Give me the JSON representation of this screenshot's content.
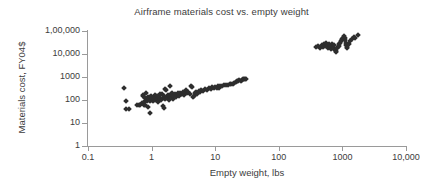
{
  "chart_data": {
    "type": "scatter",
    "title": "Airframe materials cost vs. empty weight",
    "xlabel": "Empty weight, lbs",
    "ylabel": "Materials cost, FY04$",
    "xscale": "log",
    "yscale": "log",
    "xlim": [
      0.1,
      10000
    ],
    "ylim": [
      1,
      100000
    ],
    "grid": false,
    "legend": null,
    "marker": "diamond",
    "marker_color": "#2e2e2e",
    "axis_color": "#9a9a9a",
    "xticks": [
      0.1,
      1,
      10,
      100,
      1000,
      10000
    ],
    "xticklabels": [
      "0.1",
      "1",
      "10",
      "100",
      "1000",
      "10,000"
    ],
    "yticks": [
      1,
      10,
      100,
      1000,
      10000,
      100000
    ],
    "yticklabels": [
      "1",
      "10",
      "100",
      "1000",
      "10,000",
      "1,00,000"
    ],
    "series": [
      {
        "name": "Small UAV airframes",
        "points": [
          [
            0.37,
            330
          ],
          [
            0.4,
            95
          ],
          [
            0.4,
            42
          ],
          [
            0.44,
            40
          ],
          [
            0.6,
            60
          ],
          [
            0.63,
            63
          ],
          [
            0.66,
            58
          ],
          [
            0.7,
            75
          ],
          [
            0.72,
            150
          ],
          [
            0.74,
            170
          ],
          [
            0.76,
            62
          ],
          [
            0.78,
            95
          ],
          [
            0.8,
            120
          ],
          [
            0.8,
            58
          ],
          [
            0.82,
            200
          ],
          [
            0.84,
            110
          ],
          [
            0.85,
            100
          ],
          [
            0.86,
            90
          ],
          [
            0.88,
            135
          ],
          [
            0.88,
            48
          ],
          [
            0.9,
            105
          ],
          [
            0.92,
            115
          ],
          [
            0.94,
            130
          ],
          [
            0.95,
            28
          ],
          [
            0.96,
            88
          ],
          [
            0.98,
            150
          ],
          [
            1.0,
            100
          ],
          [
            1.02,
            118
          ],
          [
            1.05,
            92
          ],
          [
            1.08,
            140
          ],
          [
            1.1,
            108
          ],
          [
            1.12,
            160
          ],
          [
            1.15,
            98
          ],
          [
            1.18,
            125
          ],
          [
            1.2,
            112
          ],
          [
            1.22,
            145
          ],
          [
            1.25,
            105
          ],
          [
            1.28,
            78
          ],
          [
            1.3,
            132
          ],
          [
            1.32,
            96
          ],
          [
            1.35,
            115
          ],
          [
            1.38,
            175
          ],
          [
            1.4,
            102
          ],
          [
            1.45,
            190
          ],
          [
            1.5,
            120
          ],
          [
            1.5,
            55
          ],
          [
            1.55,
            150
          ],
          [
            1.58,
            44
          ],
          [
            1.6,
            108
          ],
          [
            1.65,
            300
          ],
          [
            1.7,
            260
          ],
          [
            1.72,
            135
          ],
          [
            1.75,
            118
          ],
          [
            1.8,
            160
          ],
          [
            1.85,
            98
          ],
          [
            1.9,
            145
          ],
          [
            1.95,
            420
          ],
          [
            2.0,
            130
          ],
          [
            2.05,
            175
          ],
          [
            2.1,
            205
          ],
          [
            2.15,
            112
          ],
          [
            2.2,
            150
          ],
          [
            2.3,
            185
          ],
          [
            2.4,
            140
          ],
          [
            2.5,
            170
          ],
          [
            2.6,
            198
          ],
          [
            2.7,
            155
          ],
          [
            2.8,
            210
          ],
          [
            2.9,
            178
          ],
          [
            3.0,
            190
          ],
          [
            3.1,
            230
          ],
          [
            3.2,
            165
          ],
          [
            3.4,
            205
          ],
          [
            3.5,
            260
          ],
          [
            3.6,
            195
          ],
          [
            3.8,
            225
          ],
          [
            4.0,
            175
          ],
          [
            4.2,
            420
          ],
          [
            4.3,
            380
          ],
          [
            4.5,
            140
          ],
          [
            4.6,
            155
          ],
          [
            4.8,
            200
          ],
          [
            5.0,
            230
          ],
          [
            5.2,
            185
          ],
          [
            5.5,
            250
          ],
          [
            5.8,
            215
          ],
          [
            6.0,
            270
          ],
          [
            6.5,
            240
          ],
          [
            7.0,
            300
          ],
          [
            7.5,
            265
          ],
          [
            8.0,
            330
          ],
          [
            8.5,
            290
          ],
          [
            9.0,
            350
          ],
          [
            9.5,
            320
          ],
          [
            10.0,
            360
          ],
          [
            10.5,
            335
          ],
          [
            11.0,
            390
          ],
          [
            11.5,
            345
          ],
          [
            12.0,
            420
          ],
          [
            13.0,
            400
          ],
          [
            14.0,
            440
          ],
          [
            15.0,
            460
          ],
          [
            16.0,
            430
          ],
          [
            17.0,
            500
          ],
          [
            18.0,
            520
          ],
          [
            19.0,
            490
          ],
          [
            20.0,
            560
          ],
          [
            21.0,
            600
          ],
          [
            22.0,
            640
          ],
          [
            23.0,
            680
          ],
          [
            24.0,
            720
          ],
          [
            25.0,
            700
          ],
          [
            26.0,
            760
          ],
          [
            27.0,
            800
          ],
          [
            28.0,
            820
          ],
          [
            29.0,
            860
          ],
          [
            30.0,
            840
          ]
        ]
      },
      {
        "name": "Large airframes",
        "points": [
          [
            390,
            20000
          ],
          [
            420,
            22000
          ],
          [
            450,
            19000
          ],
          [
            470,
            24000
          ],
          [
            500,
            21000
          ],
          [
            520,
            26000
          ],
          [
            540,
            23000
          ],
          [
            560,
            30000
          ],
          [
            580,
            25000
          ],
          [
            600,
            18000
          ],
          [
            620,
            28000
          ],
          [
            640,
            22000
          ],
          [
            660,
            16000
          ],
          [
            680,
            26000
          ],
          [
            700,
            21000
          ],
          [
            720,
            19000
          ],
          [
            740,
            24000
          ],
          [
            760,
            15000
          ],
          [
            780,
            13000
          ],
          [
            800,
            12000
          ],
          [
            820,
            18000
          ],
          [
            850,
            20000
          ],
          [
            880,
            27000
          ],
          [
            900,
            23000
          ],
          [
            920,
            30000
          ],
          [
            950,
            35000
          ],
          [
            980,
            40000
          ],
          [
            1000,
            46000
          ],
          [
            1020,
            52000
          ],
          [
            1050,
            60000
          ],
          [
            1080,
            50000
          ],
          [
            1100,
            42000
          ],
          [
            1120,
            30000
          ],
          [
            1150,
            24000
          ],
          [
            1180,
            18000
          ],
          [
            1200,
            20000
          ],
          [
            1250,
            26000
          ],
          [
            1300,
            35000
          ],
          [
            1400,
            45000
          ],
          [
            1500,
            55000
          ],
          [
            1600,
            48000
          ],
          [
            1750,
            65000
          ]
        ]
      }
    ]
  }
}
